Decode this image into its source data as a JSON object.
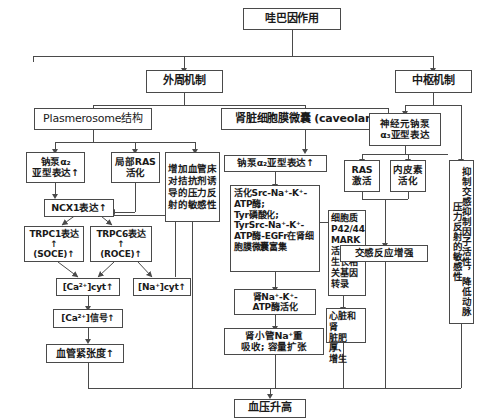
{
  "diagram": {
    "title": "哇巴因作用",
    "type": "flowchart",
    "orientation": "top-down",
    "nodes": {
      "root": "哇巴因作用",
      "peripheral_mechanism": "外周机制",
      "central_mechanism": "中枢机制",
      "plasmerosome": "Plasmerosome结构",
      "renal_caveolae": "肾脏细胞膜微囊 (caveolar)",
      "neuron_na_pump": "神经元钠泵\nα₃亚型表达",
      "na_pump_a2": "钠泵α₂\n亚型表达↑",
      "local_ras": "局部RAS\n活化",
      "vascular_bed_sensitivity": "增加血管床对拮抗剂诱导的压力反射的敏感性",
      "na_pump_a2_caveolar": "钠泵α₂亚型表达↑",
      "src_cascade": "活化Src-Na⁺-K⁺-ATP酶;\nTyr磷酸化;\nTyrSrc-Na⁺-K⁺-ATP酶-EGFr在肾细胞膜微囊富集",
      "ras_activation": "RAS\n激活",
      "endothelin_activation": "内皮素\n活化",
      "sympathetic_inhibitor": "抑制交感抑制因子活性，降低动脉压力反射的敏感性",
      "ncx1": "NCX1表达↑",
      "trpc1": "TRPC1表达↑\n(SOCE)↑",
      "trpc6": "TRPC6表达↑\n(ROCE)↑",
      "ca_cyt": "[Ca²⁺]cyt↑",
      "na_cyt": "[Na⁺]cyt↑",
      "ca_signal": "[Ca²⁺]信号↑",
      "vascular_tone": "血管紧张度↑",
      "renal_atpase": "肾Na⁺-K⁺-\nATP酶活化",
      "renal_tubule_na": "肾小管Na⁺重\n吸收; 容量扩张",
      "p42_mark": "细胞质\nP42/44\nMARK\n活化;\n生长相\n关基因\n转录",
      "sympathetic_response": "交感反应增强",
      "cardiac_renal_hypertrophy": "心脏和肾\n脏肥厚、\n增生",
      "blood_pressure": "血压升高"
    },
    "colors": {
      "border": "#4a4a4a",
      "background": "#ffffff",
      "text": "#1a1a1a"
    }
  }
}
